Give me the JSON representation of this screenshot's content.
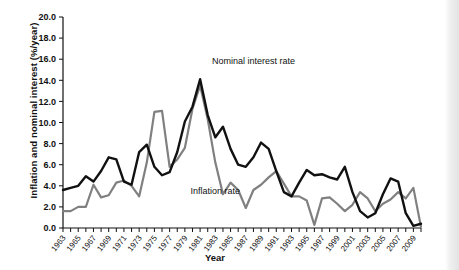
{
  "chart_data": {
    "type": "line",
    "title": "",
    "xlabel": "Year",
    "ylabel": "Inflation and nominal interest (%/year)",
    "ylim": [
      0.0,
      20.0
    ],
    "xlim": [
      1963,
      2010
    ],
    "ytick_labels": [
      "0.0",
      "2.0",
      "4.0",
      "6.0",
      "8.0",
      "10.0",
      "12.0",
      "14.0",
      "16.0",
      "18.0",
      "20.0"
    ],
    "ytick_values": [
      0,
      2,
      4,
      6,
      8,
      10,
      12,
      14,
      16,
      18,
      20
    ],
    "xtick_labels": [
      "1963",
      "1965",
      "1967",
      "1969",
      "1971",
      "1973",
      "1975",
      "1977",
      "1979",
      "1981",
      "1983",
      "1985",
      "1987",
      "1989",
      "1991",
      "1993",
      "1995",
      "1997",
      "1999",
      "2001",
      "2003",
      "2005",
      "2007",
      "2009"
    ],
    "grid": false,
    "legend_position": "inline-annotations",
    "x": [
      1963,
      1964,
      1965,
      1966,
      1967,
      1968,
      1969,
      1970,
      1971,
      1972,
      1973,
      1974,
      1975,
      1976,
      1977,
      1978,
      1979,
      1980,
      1981,
      1982,
      1983,
      1984,
      1985,
      1986,
      1987,
      1988,
      1989,
      1990,
      1991,
      1992,
      1993,
      1994,
      1995,
      1996,
      1997,
      1998,
      1999,
      2000,
      2001,
      2002,
      2003,
      2004,
      2005,
      2006,
      2007,
      2008,
      2009,
      2010
    ],
    "series": [
      {
        "name": "Nominal interest rate",
        "color": "#111111",
        "values": [
          3.6,
          3.8,
          4.0,
          4.9,
          4.4,
          5.4,
          6.7,
          6.5,
          4.4,
          4.1,
          7.2,
          7.9,
          5.8,
          5.0,
          5.3,
          7.2,
          10.1,
          11.5,
          14.1,
          10.7,
          8.6,
          9.6,
          7.5,
          6.0,
          5.8,
          6.7,
          8.1,
          7.5,
          5.4,
          3.4,
          3.0,
          4.3,
          5.5,
          5.0,
          5.1,
          4.8,
          4.6,
          5.8,
          3.4,
          1.6,
          1.0,
          1.4,
          3.2,
          4.7,
          4.4,
          1.4,
          0.2,
          0.4
        ]
      },
      {
        "name": "Inflation rate",
        "color": "#808080",
        "values": [
          1.6,
          1.6,
          2.0,
          2.0,
          4.1,
          2.9,
          3.1,
          4.3,
          4.5,
          4.0,
          3.0,
          6.2,
          11.0,
          11.1,
          5.8,
          6.5,
          7.6,
          11.3,
          13.5,
          10.3,
          6.2,
          3.2,
          4.3,
          3.6,
          1.9,
          3.6,
          4.1,
          4.8,
          5.4,
          4.2,
          3.0,
          3.0,
          2.6,
          0.3,
          2.8,
          2.9,
          2.3,
          1.6,
          2.2,
          3.4,
          2.8,
          1.6,
          2.3,
          2.7,
          3.4,
          2.8,
          3.8,
          0.1
        ]
      }
    ],
    "annotations": [
      {
        "text": "Nominal interest rate",
        "x": 1988,
        "y": 15.5
      },
      {
        "text": "Inflation rate",
        "x": 1983,
        "y": 3.2
      }
    ]
  }
}
